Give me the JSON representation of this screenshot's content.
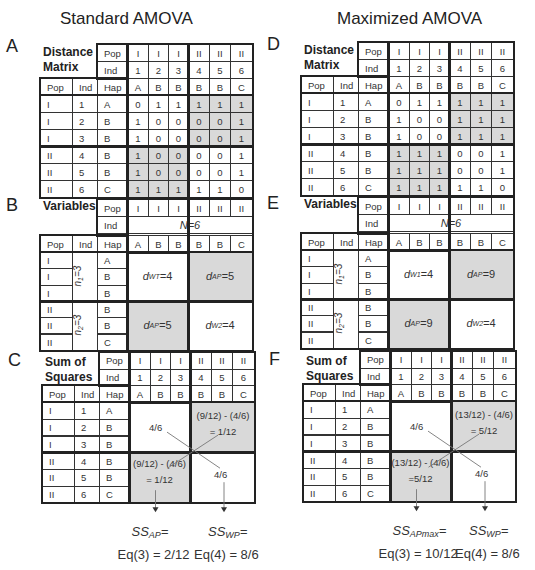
{
  "titles": {
    "left": "Standard AMOVA",
    "right": "Maximized AMOVA"
  },
  "colors": {
    "shade": "#d9d9d9",
    "border": "#222222"
  },
  "panels": {
    "A": {
      "letter": "A",
      "title_line1": "Distance",
      "title_line2": "Matrix",
      "header": {
        "pop_label": "Pop",
        "ind_label": "Ind",
        "hap_label": "Hap",
        "pops": [
          "I",
          "I",
          "I",
          "II",
          "II",
          "II"
        ],
        "inds": [
          "1",
          "2",
          "3",
          "4",
          "5",
          "6"
        ],
        "haps": [
          "A",
          "B",
          "B",
          "B",
          "B",
          "C"
        ]
      },
      "rows": [
        {
          "pop": "I",
          "ind": "1",
          "hap": "A",
          "values": [
            "0",
            "1",
            "1",
            "1",
            "1",
            "1"
          ]
        },
        {
          "pop": "I",
          "ind": "2",
          "hap": "B",
          "values": [
            "1",
            "0",
            "0",
            "0",
            "0",
            "1"
          ]
        },
        {
          "pop": "I",
          "ind": "3",
          "hap": "B",
          "values": [
            "1",
            "0",
            "0",
            "0",
            "0",
            "1"
          ]
        },
        {
          "pop": "II",
          "ind": "4",
          "hap": "B",
          "values": [
            "1",
            "0",
            "0",
            "0",
            "0",
            "1"
          ]
        },
        {
          "pop": "II",
          "ind": "5",
          "hap": "B",
          "values": [
            "1",
            "0",
            "0",
            "0",
            "0",
            "1"
          ]
        },
        {
          "pop": "II",
          "ind": "6",
          "hap": "C",
          "values": [
            "1",
            "1",
            "1",
            "1",
            "1",
            "0"
          ]
        }
      ]
    },
    "B": {
      "letter": "B",
      "title": "Variables",
      "header": {
        "pop_label": "Pop",
        "ind_label": "Ind",
        "hap_label": "Hap",
        "pops": [
          "I",
          "I",
          "I",
          "II",
          "II",
          "II"
        ],
        "n_total": "N=6",
        "haps": [
          "A",
          "B",
          "B",
          "B",
          "B",
          "C"
        ]
      },
      "row_pops": [
        "I",
        "I",
        "I",
        "II",
        "II",
        "II"
      ],
      "row_haps": [
        "A",
        "B",
        "B",
        "B",
        "B",
        "C"
      ],
      "n1": "n1=3",
      "n2": "n2=3",
      "blocks": {
        "w1": "4",
        "ap_top": "5",
        "ap_bottom": "5",
        "w2": "4"
      }
    },
    "C": {
      "letter": "C",
      "title_line1": "Sum of",
      "title_line2": "Squares",
      "header": {
        "pop_label": "Pop",
        "ind_label": "Ind",
        "hap_label": "Hap",
        "pops": [
          "I",
          "I",
          "I",
          "II",
          "II",
          "II"
        ],
        "inds": [
          "1",
          "2",
          "3",
          "4",
          "5",
          "6"
        ],
        "haps": [
          "A",
          "B",
          "B",
          "B",
          "B",
          "C"
        ]
      },
      "rows": [
        {
          "pop": "I",
          "ind": "1",
          "hap": "A"
        },
        {
          "pop": "I",
          "ind": "2",
          "hap": "B"
        },
        {
          "pop": "I",
          "ind": "3",
          "hap": "B"
        },
        {
          "pop": "II",
          "ind": "4",
          "hap": "B"
        },
        {
          "pop": "II",
          "ind": "5",
          "hap": "B"
        },
        {
          "pop": "II",
          "ind": "6",
          "hap": "C"
        }
      ],
      "within_top": "4/6",
      "within_bottom": "4/6",
      "among_top_expr": "(9/12) - (4/6)",
      "among_top_result": "= 1/12",
      "among_bottom_expr": "(9/12) - (4/6)",
      "among_bottom_result": "= 1/12",
      "ss_among_label": "SS",
      "ss_among_sub": "AP",
      "ss_among_eq": "Eq(3) = 2/12",
      "ss_within_label": "SS",
      "ss_within_sub": "WP",
      "ss_within_eq": "Eq(4) = 8/6"
    },
    "D": {
      "letter": "D",
      "title_line1": "Distance",
      "title_line2": "Matrix",
      "header": {
        "pop_label": "Pop",
        "ind_label": "Ind",
        "hap_label": "Hap",
        "pops": [
          "I",
          "I",
          "I",
          "II",
          "II",
          "II"
        ],
        "inds": [
          "1",
          "2",
          "3",
          "4",
          "5",
          "6"
        ],
        "haps": [
          "A",
          "B",
          "B",
          "B",
          "B",
          "C"
        ]
      },
      "rows": [
        {
          "pop": "I",
          "ind": "1",
          "hap": "A",
          "values": [
            "0",
            "1",
            "1",
            "1",
            "1",
            "1"
          ]
        },
        {
          "pop": "I",
          "ind": "2",
          "hap": "B",
          "values": [
            "1",
            "0",
            "0",
            "1",
            "1",
            "1"
          ]
        },
        {
          "pop": "I",
          "ind": "3",
          "hap": "B",
          "values": [
            "1",
            "0",
            "0",
            "1",
            "1",
            "1"
          ]
        },
        {
          "pop": "II",
          "ind": "4",
          "hap": "B",
          "values": [
            "1",
            "1",
            "1",
            "0",
            "0",
            "1"
          ]
        },
        {
          "pop": "II",
          "ind": "5",
          "hap": "B",
          "values": [
            "1",
            "1",
            "1",
            "0",
            "0",
            "1"
          ]
        },
        {
          "pop": "II",
          "ind": "6",
          "hap": "C",
          "values": [
            "1",
            "1",
            "1",
            "1",
            "1",
            "0"
          ]
        }
      ]
    },
    "E": {
      "letter": "E",
      "title": "Variables",
      "header": {
        "pop_label": "Pop",
        "ind_label": "Ind",
        "hap_label": "Hap",
        "pops": [
          "I",
          "I",
          "I",
          "II",
          "II",
          "II"
        ],
        "n_total": "N=6",
        "haps": [
          "A",
          "B",
          "B",
          "B",
          "B",
          "C"
        ]
      },
      "row_pops": [
        "I",
        "I",
        "I",
        "II",
        "II",
        "II"
      ],
      "row_haps": [
        "A",
        "B",
        "B",
        "B",
        "B",
        "C"
      ],
      "n1": "n1=3",
      "n2": "n2=3",
      "blocks": {
        "w1": "4",
        "ap_top": "9",
        "ap_bottom": "9",
        "w2": "4"
      }
    },
    "F": {
      "letter": "F",
      "title_line1": "Sum of",
      "title_line2": "Squares",
      "header": {
        "pop_label": "Pop",
        "ind_label": "Ind",
        "hap_label": "Hap",
        "pops": [
          "I",
          "I",
          "I",
          "II",
          "II",
          "II"
        ],
        "inds": [
          "1",
          "2",
          "3",
          "4",
          "5",
          "6"
        ],
        "haps": [
          "A",
          "B",
          "B",
          "B",
          "B",
          "C"
        ]
      },
      "rows": [
        {
          "pop": "I",
          "ind": "1",
          "hap": "A"
        },
        {
          "pop": "I",
          "ind": "2",
          "hap": "B"
        },
        {
          "pop": "I",
          "ind": "3",
          "hap": "B"
        },
        {
          "pop": "II",
          "ind": "4",
          "hap": "B"
        },
        {
          "pop": "II",
          "ind": "5",
          "hap": "B"
        },
        {
          "pop": "II",
          "ind": "6",
          "hap": "C"
        }
      ],
      "within_top": "4/6",
      "within_bottom": "4/6",
      "among_top_expr": "(13/12) - (4/6)",
      "among_top_result": "= 5/12",
      "among_bottom_expr": "(13/12) - (4/6)",
      "among_bottom_result": "=5/12",
      "ss_among_label": "SS",
      "ss_among_sub": "APmax",
      "ss_among_eq": "Eq(3) = 10/12",
      "ss_within_label": "SS",
      "ss_within_sub": "WP",
      "ss_within_eq": "Eq(4) = 8/6"
    }
  }
}
